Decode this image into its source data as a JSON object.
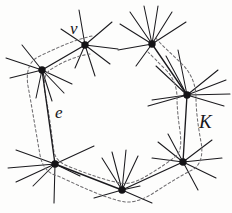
{
  "figure": {
    "kind": "graph-diagram",
    "background_color": "#fdfdfc",
    "ink_color": "#1b1a1e",
    "dash_color": "#6f6d70"
  },
  "labels": {
    "vertex_v": "v",
    "edge_e": "e",
    "region_K": "K"
  },
  "vertices": [
    {
      "id": "v1",
      "name": "v",
      "x": 85,
      "y": 45
    },
    {
      "id": "v2",
      "name": "",
      "x": 42,
      "y": 70
    },
    {
      "id": "v3",
      "name": "",
      "x": 55,
      "y": 164
    },
    {
      "id": "v4",
      "name": "",
      "x": 122,
      "y": 190
    },
    {
      "id": "v5",
      "name": "",
      "x": 183,
      "y": 162
    },
    {
      "id": "v6",
      "name": "",
      "x": 187,
      "y": 95
    },
    {
      "id": "v7",
      "name": "",
      "x": 152,
      "y": 44
    }
  ],
  "edges": [
    {
      "from": "v1",
      "to": "v2",
      "label": ""
    },
    {
      "from": "v2",
      "to": "v3",
      "label": "e"
    },
    {
      "from": "v3",
      "to": "v4",
      "label": ""
    },
    {
      "from": "v4",
      "to": "v5",
      "label": ""
    },
    {
      "from": "v5",
      "to": "v6",
      "label": ""
    },
    {
      "from": "v6",
      "to": "v7",
      "label": ""
    }
  ],
  "pendant_edges": {
    "v1": [
      [
        61,
        29
      ],
      [
        112,
        22
      ],
      [
        79,
        12
      ],
      [
        118,
        49
      ],
      [
        110,
        62
      ],
      [
        95,
        74
      ],
      [
        75,
        66
      ]
    ],
    "v2": [
      [
        8,
        58
      ],
      [
        24,
        47
      ],
      [
        12,
        77
      ],
      [
        70,
        84
      ],
      [
        62,
        92
      ],
      [
        50,
        100
      ],
      [
        36,
        96
      ]
    ],
    "v3": [
      [
        18,
        150
      ],
      [
        10,
        166
      ],
      [
        16,
        180
      ],
      [
        33,
        184
      ],
      [
        55,
        200
      ],
      [
        92,
        147
      ],
      [
        78,
        172
      ]
    ],
    "v4": [
      [
        100,
        162
      ],
      [
        112,
        152
      ],
      [
        128,
        150
      ],
      [
        140,
        157
      ],
      [
        96,
        196
      ],
      [
        152,
        200
      ],
      [
        140,
        186
      ]
    ],
    "v5": [
      [
        160,
        142
      ],
      [
        170,
        135
      ],
      [
        155,
        158
      ],
      [
        208,
        140
      ],
      [
        216,
        158
      ],
      [
        212,
        176
      ],
      [
        196,
        186
      ]
    ],
    "v6": [
      [
        158,
        66
      ],
      [
        166,
        58
      ],
      [
        178,
        52
      ],
      [
        214,
        72
      ],
      [
        222,
        82
      ],
      [
        226,
        95
      ],
      [
        218,
        108
      ],
      [
        160,
        100
      ],
      [
        152,
        104
      ]
    ],
    "v7": [
      [
        122,
        26
      ],
      [
        132,
        14
      ],
      [
        146,
        8
      ],
      [
        160,
        10
      ],
      [
        172,
        16
      ],
      [
        183,
        26
      ],
      [
        120,
        52
      ],
      [
        138,
        66
      ]
    ]
  },
  "contour": {
    "style": "dashed",
    "label": "K",
    "note": "Two dashed strands run on either side of the path, joining around each end vertex"
  }
}
